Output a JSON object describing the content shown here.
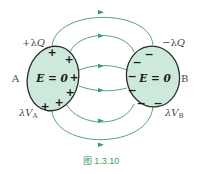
{
  "figure": {
    "caption": "图 1.3.10",
    "colors": {
      "conductor_fill": "#cde9dc",
      "conductor_stroke": "#2b2b2b",
      "field_line": "#3f9a68",
      "caption": "#3aa066"
    }
  },
  "conductor_a": {
    "name": "A",
    "charge_label_prefix": "+λ",
    "charge_label_var": "Q",
    "potential_label_prefix": "λ",
    "potential_label_var": "V",
    "potential_label_sub": "A",
    "field_label": "E = 0",
    "surface_charges": [
      "+",
      "+",
      "+",
      "+",
      "+",
      "+"
    ]
  },
  "conductor_b": {
    "name": "B",
    "charge_label_prefix": "−λ",
    "charge_label_var": "Q",
    "potential_label_prefix": "λ",
    "potential_label_var": "V",
    "potential_label_sub": "B",
    "field_label": "E = 0",
    "surface_charges": [
      "−",
      "−",
      "−",
      "−",
      "−",
      "−"
    ]
  },
  "field_lines": {
    "count": 6,
    "direction": "A to B"
  }
}
